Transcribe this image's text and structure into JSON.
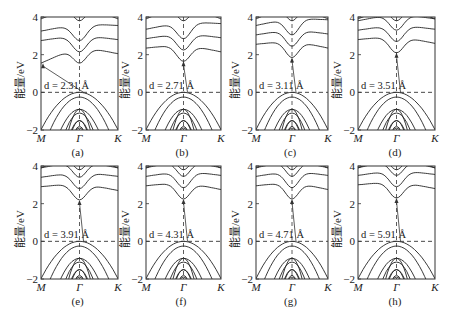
{
  "chart_data": [
    {
      "id": "a",
      "caption": "(a)",
      "d_label": "d = 2.31 Å",
      "d": 2.31,
      "cbm_eV": 1.55,
      "vbm_eV": 0.0,
      "cbm_k": "M",
      "gap_type": "indirect"
    },
    {
      "id": "b",
      "caption": "(b)",
      "d_label": "d = 2.71 Å",
      "d": 2.71,
      "cbm_eV": 1.65,
      "vbm_eV": 0.0,
      "cbm_k": "Γ",
      "gap_type": "indirect"
    },
    {
      "id": "c",
      "caption": "(c)",
      "d_label": "d = 3.11 Å",
      "d": 3.11,
      "cbm_eV": 1.85,
      "vbm_eV": 0.0,
      "cbm_k": "Γ",
      "gap_type": "indirect"
    },
    {
      "id": "d",
      "caption": "(d)",
      "d_label": "d = 3.51 Å",
      "d": 3.51,
      "cbm_eV": 2.1,
      "vbm_eV": 0.0,
      "cbm_k": "Γ",
      "gap_type": "near-direct"
    },
    {
      "id": "e",
      "caption": "(e)",
      "d_label": "d = 3.91 Å",
      "d": 3.91,
      "cbm_eV": 2.2,
      "vbm_eV": 0.0,
      "cbm_k": "Γ",
      "gap_type": "direct"
    },
    {
      "id": "f",
      "caption": "(f)",
      "d_label": "d = 4.31 Å",
      "d": 4.31,
      "cbm_eV": 2.25,
      "vbm_eV": 0.0,
      "cbm_k": "Γ",
      "gap_type": "direct"
    },
    {
      "id": "g",
      "caption": "(g)",
      "d_label": "d = 4.71 Å",
      "d": 4.71,
      "cbm_eV": 2.25,
      "vbm_eV": 0.0,
      "cbm_k": "Γ",
      "gap_type": "direct"
    },
    {
      "id": "h",
      "caption": "(h)",
      "d_label": "d = 5.91 Å",
      "d": 5.91,
      "cbm_eV": 2.3,
      "vbm_eV": 0.0,
      "cbm_k": "Γ",
      "gap_type": "direct"
    }
  ],
  "common": {
    "type": "line",
    "ylabel": "能量/eV",
    "ylim": [
      -2,
      4
    ],
    "yticks": [
      "4",
      "2",
      "0",
      "−2"
    ],
    "xticks": [
      "M",
      "Γ",
      "K"
    ],
    "fermi_level_eV": 0,
    "fermi_line": "dashed",
    "gamma_line": "dashed"
  }
}
